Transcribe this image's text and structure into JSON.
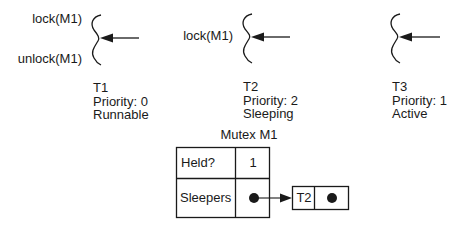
{
  "threads": [
    {
      "name": "T1",
      "priority_label": "Priority: 0",
      "state": "Runnable",
      "code_labels": [
        "lock(M1)",
        "unlock(M1)"
      ]
    },
    {
      "name": "T2",
      "priority_label": "Priority: 2",
      "state": "Sleeping",
      "code_labels": [
        "lock(M1)"
      ]
    },
    {
      "name": "T3",
      "priority_label": "Priority: 1",
      "state": "Active",
      "code_labels": []
    }
  ],
  "mutex": {
    "title": "Mutex M1",
    "rows": [
      {
        "field": "Held?",
        "value": "1"
      },
      {
        "field": "Sleepers",
        "value": "pointer"
      }
    ],
    "sleeper_queue": [
      {
        "name": "T2",
        "next": "pointer"
      }
    ]
  },
  "colors": {
    "ink": "#1a1a1a",
    "background": "#ffffff"
  }
}
